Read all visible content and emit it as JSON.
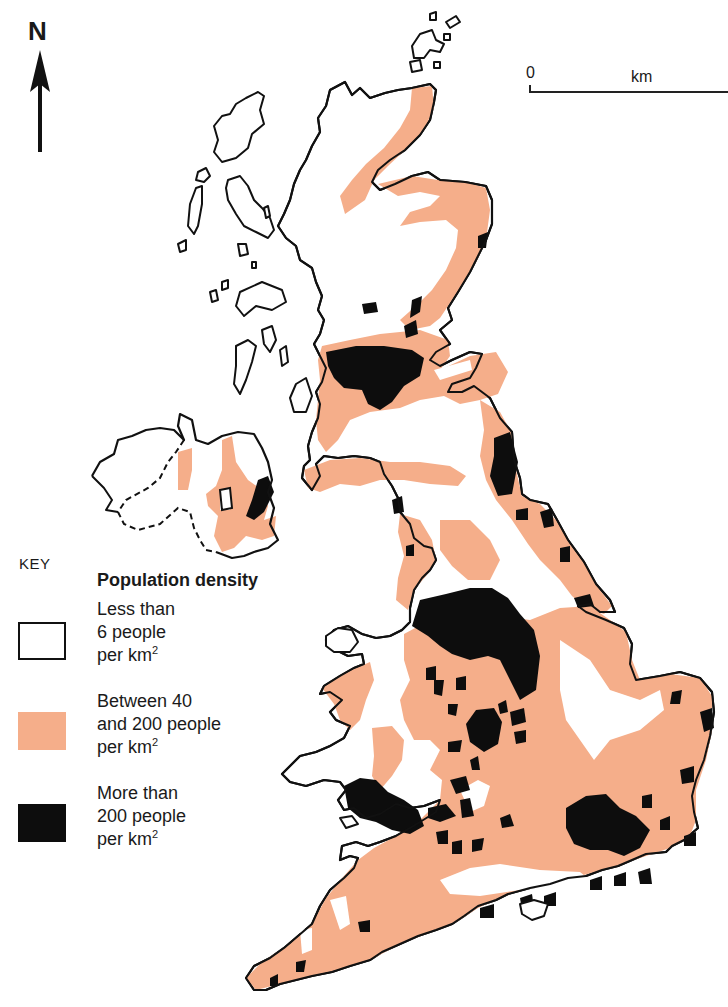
{
  "compass": {
    "label": "N",
    "icon": "north-arrow-icon"
  },
  "scale_bar": {
    "start_label": "0",
    "unit_label": "km"
  },
  "colors": {
    "low": "#ffffff",
    "medium": "#f5ae8a",
    "high": "#0d0d0d",
    "outline": "#111111"
  },
  "legend": {
    "key_label": "KEY",
    "heading": "Population density",
    "items": [
      {
        "line1": "Less than",
        "line2": "6 people",
        "line3": "per km",
        "sup": "2",
        "color": "#ffffff"
      },
      {
        "line1": "Between 40",
        "line2": "and 200 people",
        "line3": "per km",
        "sup": "2",
        "color": "#f5ae8a"
      },
      {
        "line1": "More than",
        "line2": "200 people",
        "line3": "per km",
        "sup": "2",
        "color": "#0d0d0d"
      }
    ]
  },
  "map": {
    "subject": "Population density of the United Kingdom",
    "regions": [
      "Scotland",
      "Northern Ireland",
      "England",
      "Wales"
    ]
  }
}
